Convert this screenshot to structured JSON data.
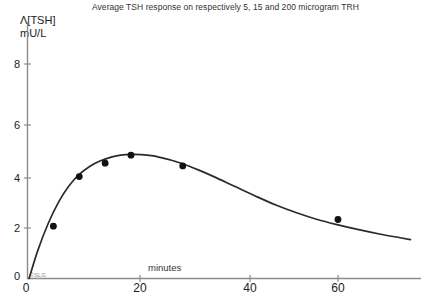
{
  "chart_data": {
    "type": "scatter",
    "title": "Average TSH response on respectively 5, 15 and 200 microgram TRH",
    "xlabel": "minutes",
    "ylabel_line1": "Λ[TSH]",
    "ylabel_line2": "mU/L",
    "xlim": [
      0,
      74
    ],
    "ylim": [
      0,
      9.2
    ],
    "xticks": [
      0,
      20,
      40,
      60
    ],
    "xtick_labels": [
      "0",
      "20",
      "40",
      "60"
    ],
    "yticks": [
      0,
      2,
      4,
      6,
      8
    ],
    "ytick_labels": [
      "0",
      "2",
      "4",
      "6",
      "8"
    ],
    "grid": false,
    "legend": "none",
    "watermark": "©SLG",
    "origin_label": "0",
    "series": [
      {
        "name": "Average TSH response",
        "marker": "filled-circle",
        "marker_color": "#111111",
        "line_color": "#2b2b2b",
        "x": [
          5,
          10,
          15,
          20,
          30,
          60
        ],
        "y": [
          1.95,
          3.8,
          4.3,
          4.6,
          4.2,
          2.2
        ]
      }
    ],
    "fitted_curve": {
      "name": "fitted response curve",
      "x": [
        0.3,
        2,
        4,
        6,
        8,
        10,
        12,
        14,
        16,
        18,
        20,
        22,
        24,
        26,
        28,
        30,
        33,
        36,
        40,
        44,
        48,
        52,
        56,
        60,
        64,
        68,
        72,
        74
      ],
      "y": [
        0.0,
        1.05,
        2.05,
        2.85,
        3.45,
        3.88,
        4.18,
        4.38,
        4.52,
        4.6,
        4.63,
        4.62,
        4.58,
        4.5,
        4.4,
        4.28,
        4.05,
        3.8,
        3.44,
        3.08,
        2.74,
        2.45,
        2.2,
        2.0,
        1.82,
        1.66,
        1.52,
        1.45
      ]
    }
  }
}
